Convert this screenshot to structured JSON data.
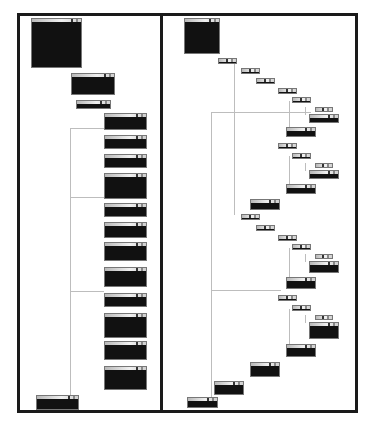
{
  "figure": {
    "panels": [
      {
        "id": "left",
        "description": "stacked sequential layout"
      },
      {
        "id": "right",
        "description": "nested staircase layout"
      }
    ],
    "colors": {
      "frame": "#1a1a1a",
      "node_fill": "#111111",
      "edge": "#bdbdbd",
      "header": "#e0e0e0"
    }
  },
  "left_nodes": [
    {
      "x": 31,
      "y": 18,
      "w": 51,
      "h": 50
    },
    {
      "x": 71,
      "y": 73,
      "w": 44,
      "h": 22
    },
    {
      "x": 76,
      "y": 100,
      "w": 35,
      "h": 9
    },
    {
      "x": 104,
      "y": 113,
      "w": 43,
      "h": 17
    },
    {
      "x": 104,
      "y": 135,
      "w": 43,
      "h": 14
    },
    {
      "x": 104,
      "y": 154,
      "w": 43,
      "h": 14
    },
    {
      "x": 104,
      "y": 173,
      "w": 43,
      "h": 26
    },
    {
      "x": 104,
      "y": 203,
      "w": 43,
      "h": 14
    },
    {
      "x": 104,
      "y": 222,
      "w": 43,
      "h": 16
    },
    {
      "x": 104,
      "y": 242,
      "w": 43,
      "h": 19
    },
    {
      "x": 104,
      "y": 267,
      "w": 43,
      "h": 20
    },
    {
      "x": 104,
      "y": 293,
      "w": 43,
      "h": 14
    },
    {
      "x": 104,
      "y": 313,
      "w": 43,
      "h": 25
    },
    {
      "x": 104,
      "y": 341,
      "w": 43,
      "h": 19
    },
    {
      "x": 104,
      "y": 366,
      "w": 43,
      "h": 24
    },
    {
      "x": 36,
      "y": 395,
      "w": 43,
      "h": 15
    }
  ],
  "right_nodes": [
    {
      "x": 184,
      "y": 18,
      "w": 36,
      "h": 36
    },
    {
      "x": 218,
      "y": 58,
      "w": 19,
      "h": 6
    },
    {
      "x": 241,
      "y": 68,
      "w": 19,
      "h": 6
    },
    {
      "x": 256,
      "y": 78,
      "w": 19,
      "h": 6
    },
    {
      "x": 278,
      "y": 88,
      "w": 19,
      "h": 6
    },
    {
      "x": 292,
      "y": 97,
      "w": 19,
      "h": 6
    },
    {
      "x": 315,
      "y": 107,
      "w": 18,
      "h": 5
    },
    {
      "x": 309,
      "y": 114,
      "w": 30,
      "h": 9
    },
    {
      "x": 286,
      "y": 127,
      "w": 30,
      "h": 10
    },
    {
      "x": 278,
      "y": 143,
      "w": 19,
      "h": 6
    },
    {
      "x": 292,
      "y": 153,
      "w": 19,
      "h": 6
    },
    {
      "x": 315,
      "y": 163,
      "w": 18,
      "h": 5
    },
    {
      "x": 309,
      "y": 170,
      "w": 30,
      "h": 9
    },
    {
      "x": 286,
      "y": 184,
      "w": 30,
      "h": 10
    },
    {
      "x": 250,
      "y": 199,
      "w": 30,
      "h": 11
    },
    {
      "x": 241,
      "y": 214,
      "w": 19,
      "h": 6
    },
    {
      "x": 256,
      "y": 225,
      "w": 19,
      "h": 6
    },
    {
      "x": 278,
      "y": 235,
      "w": 19,
      "h": 6
    },
    {
      "x": 292,
      "y": 244,
      "w": 19,
      "h": 6
    },
    {
      "x": 315,
      "y": 254,
      "w": 18,
      "h": 5
    },
    {
      "x": 309,
      "y": 261,
      "w": 30,
      "h": 12
    },
    {
      "x": 286,
      "y": 277,
      "w": 30,
      "h": 12
    },
    {
      "x": 278,
      "y": 295,
      "w": 19,
      "h": 6
    },
    {
      "x": 292,
      "y": 305,
      "w": 19,
      "h": 6
    },
    {
      "x": 315,
      "y": 315,
      "w": 18,
      "h": 5
    },
    {
      "x": 309,
      "y": 322,
      "w": 30,
      "h": 17
    },
    {
      "x": 286,
      "y": 344,
      "w": 30,
      "h": 13
    },
    {
      "x": 250,
      "y": 362,
      "w": 30,
      "h": 15
    },
    {
      "x": 214,
      "y": 381,
      "w": 30,
      "h": 14
    },
    {
      "x": 187,
      "y": 397,
      "w": 31,
      "h": 11
    }
  ],
  "left_edges": [
    {
      "x": 70,
      "y": 128,
      "w": 1,
      "h": 268
    },
    {
      "x": 70,
      "y": 128,
      "w": 34,
      "h": 1
    },
    {
      "x": 70,
      "y": 197,
      "w": 34,
      "h": 1
    },
    {
      "x": 70,
      "y": 291,
      "w": 34,
      "h": 1
    }
  ],
  "right_edges": [
    {
      "x": 211,
      "y": 112,
      "w": 1,
      "h": 285
    },
    {
      "x": 234,
      "y": 62,
      "w": 1,
      "h": 153
    },
    {
      "x": 289,
      "y": 101,
      "w": 1,
      "h": 27
    },
    {
      "x": 305,
      "y": 107,
      "w": 1,
      "h": 8
    },
    {
      "x": 289,
      "y": 156,
      "w": 1,
      "h": 29
    },
    {
      "x": 305,
      "y": 163,
      "w": 1,
      "h": 8
    },
    {
      "x": 289,
      "y": 248,
      "w": 1,
      "h": 30
    },
    {
      "x": 305,
      "y": 254,
      "w": 1,
      "h": 8
    },
    {
      "x": 289,
      "y": 309,
      "w": 1,
      "h": 36
    },
    {
      "x": 305,
      "y": 315,
      "w": 1,
      "h": 8
    },
    {
      "x": 211,
      "y": 112,
      "w": 100,
      "h": 1
    },
    {
      "x": 211,
      "y": 290,
      "w": 70,
      "h": 1
    }
  ]
}
